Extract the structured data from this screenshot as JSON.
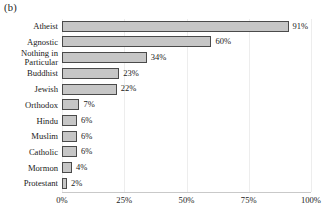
{
  "figure": {
    "panel_label": "(b)"
  },
  "chart_data": {
    "type": "bar",
    "orientation": "horizontal",
    "title": "",
    "xlabel": "",
    "ylabel": "",
    "xlim": [
      0,
      100
    ],
    "grid": true,
    "legend": "none",
    "bar_color": "#c6c6c6",
    "bar_edge_color": "#4a4a4a",
    "categories": [
      "Atheist",
      "Agnostic",
      "Nothing in\nParticular",
      "Buddhist",
      "Jewish",
      "Orthodox",
      "Hindu",
      "Muslim",
      "Catholic",
      "Mormon",
      "Protestant"
    ],
    "values": [
      91,
      60,
      34,
      23,
      22,
      7,
      6,
      6,
      6,
      4,
      2
    ],
    "value_labels": [
      "91%",
      "60%",
      "34%",
      "23%",
      "22%",
      "7%",
      "6%",
      "6%",
      "6%",
      "4%",
      "2%"
    ],
    "xticks": [
      0,
      25,
      50,
      75,
      100
    ],
    "xtick_labels": [
      "0%",
      "25%",
      "50%",
      "75%",
      "100%"
    ]
  }
}
